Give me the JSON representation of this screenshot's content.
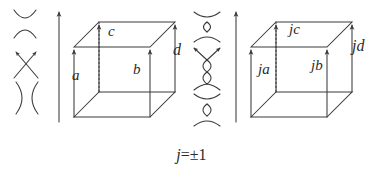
{
  "figure": {
    "caption_formula": "j=±1",
    "formula_variable": "j",
    "formula_rest": "=±1",
    "stroke_color": "#3a3a3a",
    "background_color": "#ffffff",
    "left_symbols": [
      {
        "name": "vertical-smoothing",
        "glyph": "⌣⌢",
        "description": "two arcs opening vertically"
      },
      {
        "name": "oriented-crossing",
        "glyph": "✕",
        "description": "crossing with two arrows pointing up-left and up-right"
      },
      {
        "name": "horizontal-smoothing",
        "glyph": ")(",
        "description": "two arcs opening horizontally"
      }
    ],
    "middle_symbols": [
      {
        "name": "rotated-vertical-smoothing",
        "description": "rotated smoothing symbol"
      },
      {
        "name": "rotated-oriented-crossing",
        "description": "rotated crossing with arrows"
      },
      {
        "name": "rotated-horizontal-smoothing",
        "description": "rotated smoothing symbol"
      }
    ],
    "left_cube": {
      "name": "left-cube",
      "standalone_arrow": "up-arrow",
      "edge_labels": [
        {
          "id": "a",
          "text": "a",
          "edge": "front-left-vertical"
        },
        {
          "id": "b",
          "text": "b",
          "edge": "front-center-vertical"
        },
        {
          "id": "c",
          "text": "c",
          "edge": "back-center-vertical-dotted"
        },
        {
          "id": "d",
          "text": "d",
          "edge": "front-right-vertical"
        }
      ]
    },
    "right_cube": {
      "name": "right-cube",
      "standalone_arrow": "up-arrow",
      "edge_labels": [
        {
          "id": "ja",
          "text": "ja",
          "edge": "front-left-vertical"
        },
        {
          "id": "jb",
          "text": "jb",
          "edge": "front-center-vertical"
        },
        {
          "id": "jc",
          "text": "jc",
          "edge": "back-center-vertical-dotted"
        },
        {
          "id": "jd",
          "text": "jd",
          "edge": "front-right-vertical"
        }
      ]
    }
  }
}
